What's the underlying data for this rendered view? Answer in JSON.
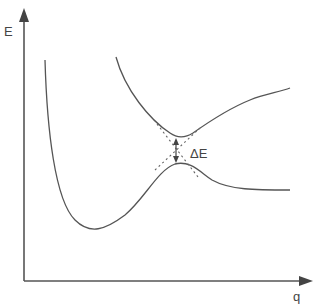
{
  "diagram": {
    "type": "avoided-crossing potential energy curves",
    "axes": {
      "y_label": "E",
      "x_label": "q"
    },
    "curves": [
      {
        "name": "lower-adiabatic-curve",
        "description": "deep well then rises to a hump near the gap and levels off"
      },
      {
        "name": "upper-adiabatic-curve",
        "description": "descends to a minimum near the gap then rises"
      },
      {
        "name": "diabatic-crossing-lines",
        "description": "dashed lines crossing at the gap"
      }
    ],
    "gap_label": "ΔE",
    "colors": {
      "line": "#555555",
      "background": "#ffffff"
    }
  }
}
